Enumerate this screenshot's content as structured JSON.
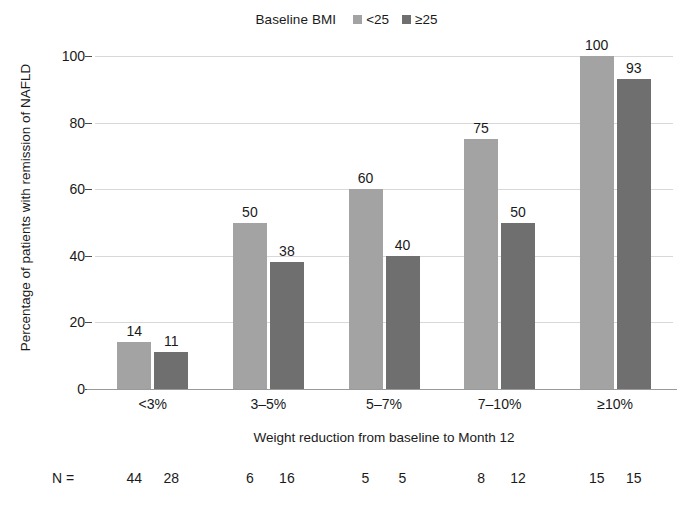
{
  "chart_data": {
    "type": "bar",
    "title": "",
    "subtitle": "",
    "xlabel": "Weight reduction from baseline to Month 12",
    "ylabel": "Percentage of patients with remission of NAFLD",
    "categories": [
      "<3%",
      "3–5%",
      "5–7%",
      "7–10%",
      "≥10%"
    ],
    "series": [
      {
        "name": "<25",
        "color": "#a3a3a3",
        "values": [
          14,
          50,
          60,
          75,
          100
        ],
        "n": [
          44,
          6,
          5,
          8,
          15
        ]
      },
      {
        "name": "≥25",
        "color": "#6f6f6f",
        "values": [
          11,
          38,
          40,
          50,
          93
        ],
        "n": [
          28,
          16,
          5,
          12,
          15
        ]
      }
    ],
    "ylim": [
      0,
      100
    ],
    "yticks": [
      0,
      20,
      40,
      60,
      80,
      100
    ],
    "ytick_labels": [
      "0",
      "20",
      "40",
      "60",
      "80",
      "100"
    ],
    "grid": true,
    "legend_position": "top-center",
    "legend_title": "Baseline BMI",
    "n_row_label": "N ="
  },
  "colors": {
    "series_light": "#a3a3a3",
    "series_dark": "#6f6f6f",
    "gridline": "#d8d8d8",
    "axis": "#9a9a9a",
    "text": "#1a1a1a",
    "background": "#ffffff"
  }
}
